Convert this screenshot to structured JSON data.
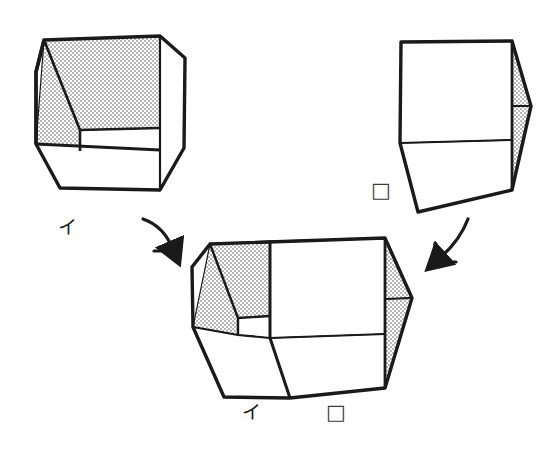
{
  "figure": {
    "title": "",
    "background_color": "#ffffff",
    "stroke_color": "#1a1a1a",
    "shade_fill_color": "#d9d9d9",
    "face_fill_color": "#ffffff",
    "shapes": [
      {
        "id": "left-cube",
        "name": "open-box-i",
        "label": "イ",
        "description": "open cube with shaded interior left wall and back wall"
      },
      {
        "id": "right-cube",
        "name": "open-box-square",
        "label": "□",
        "description": "open cube with shaded interior right wall"
      },
      {
        "id": "combined-box",
        "name": "combined-open-box",
        "labels": [
          "イ",
          "□"
        ],
        "description": "the two boxes joined side by side into a wide open box"
      }
    ],
    "arrows": [
      {
        "id": "arrow-left",
        "name": "arrow-down-right",
        "direction": "down-right"
      },
      {
        "id": "arrow-right",
        "name": "arrow-down-left",
        "direction": "down-left"
      }
    ],
    "labels": {
      "left_cube": "イ",
      "right_cube": "□",
      "combined_left": "イ",
      "combined_right": "□"
    }
  }
}
